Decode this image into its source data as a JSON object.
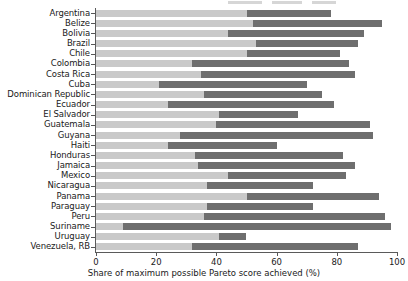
{
  "chart_data": {
    "type": "bar",
    "orientation": "horizontal",
    "title": "",
    "xlabel": "Share of maximum possible Pareto score achieved (%)",
    "ylabel": "",
    "xlim": [
      0,
      100
    ],
    "xticks": [
      0,
      20,
      40,
      60,
      80,
      100
    ],
    "xtick_labels": [
      "0",
      "20",
      "40",
      "60",
      "80",
      "100"
    ],
    "grid": false,
    "legend_position": "top",
    "stacked": true,
    "colors": {
      "segment_light": "#c9c9c9",
      "segment_dark": "#6e6e6e",
      "axis": "#5a5a5a",
      "text": "#1a1a1a",
      "background": "#ffffff"
    },
    "categories": [
      "Argentina",
      "Belize",
      "Bolivia",
      "Brazil",
      "Chile",
      "Colombia",
      "Costa Rica",
      "Cuba",
      "Dominican Republic",
      "Ecuador",
      "El Salvador",
      "Guatemala",
      "Guyana",
      "Haiti",
      "Honduras",
      "Jamaica",
      "Mexico",
      "Nicaragua",
      "Panama",
      "Paraguay",
      "Peru",
      "Suriname",
      "Uruguay",
      "Venezuela, RB"
    ],
    "series": [
      {
        "name": "light-segment",
        "color": "#c9c9c9",
        "values": [
          50,
          52,
          44,
          53,
          50,
          32,
          35,
          21,
          36,
          24,
          41,
          40,
          28,
          24,
          33,
          34,
          44,
          37,
          50,
          37,
          36,
          9,
          41,
          32
        ]
      },
      {
        "name": "dark-segment",
        "color": "#6e6e6e",
        "values": [
          28,
          43,
          45,
          34,
          31,
          52,
          51,
          49,
          39,
          55,
          26,
          51,
          64,
          36,
          49,
          52,
          39,
          35,
          44,
          35,
          60,
          89,
          9,
          55
        ]
      }
    ],
    "totals": [
      78,
      95,
      89,
      87,
      81,
      84,
      86,
      70,
      75,
      79,
      67,
      91,
      92,
      60,
      82,
      86,
      83,
      72,
      94,
      72,
      96,
      98,
      50,
      87
    ]
  }
}
